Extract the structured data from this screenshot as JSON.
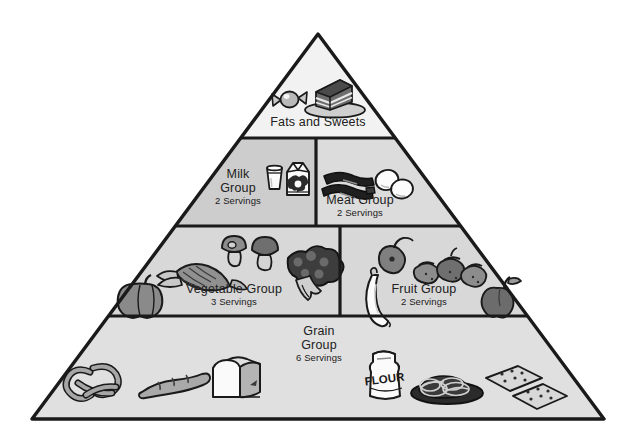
{
  "diagram": {
    "type": "food-guide-pyramid",
    "background_color": "#ffffff",
    "outline_color": "#1a1a1a",
    "tiers": [
      {
        "id": "fats-sweets",
        "label": "Fats and Sweets",
        "label_lines": [
          "Fats and Sweets"
        ],
        "servings": "",
        "fill_color": "#f2f2f2",
        "tier_index": 1,
        "icons": [
          "wrapped-candy-icon",
          "cake-slice-icon"
        ]
      },
      {
        "id": "milk-group",
        "label": "Milk Group",
        "label_lines": [
          "Milk",
          "Group"
        ],
        "servings": "2 Servings",
        "servings_count": 2,
        "fill_color": "#cdcdcd",
        "tier_index": 2,
        "icons": [
          "milk-glass-icon",
          "milk-carton-icon"
        ]
      },
      {
        "id": "meat-group",
        "label": "Meat Group",
        "label_lines": [
          "Meat Group"
        ],
        "servings": "2 Servings",
        "servings_count": 2,
        "fill_color": "#dcdcdc",
        "tier_index": 2,
        "icons": [
          "bacon-icon",
          "eggs-icon"
        ]
      },
      {
        "id": "vegetable-group",
        "label": "Vegetable Group",
        "label_lines": [
          "Vegetable Group"
        ],
        "servings": "3 Servings",
        "servings_count": 3,
        "fill_color": "#d8d8d8",
        "tier_index": 3,
        "icons": [
          "squash-icon",
          "corn-icon",
          "mushrooms-icon",
          "broccoli-icon"
        ]
      },
      {
        "id": "fruit-group",
        "label": "Fruit Group",
        "label_lines": [
          "Fruit Group"
        ],
        "servings": "2 Servings",
        "servings_count": 2,
        "fill_color": "#d8d8d8",
        "tier_index": 3,
        "icons": [
          "pear-icon",
          "strawberries-icon",
          "banana-icon",
          "apple-icon"
        ]
      },
      {
        "id": "grain-group",
        "label": "Grain Group",
        "label_lines": [
          "Grain",
          "Group"
        ],
        "servings": "6 Servings",
        "servings_count": 6,
        "fill_color": "#e0e0e0",
        "tier_index": 4,
        "icons": [
          "pretzel-icon",
          "baguette-icon",
          "bread-loaf-icon",
          "flour-bag-icon",
          "spaghetti-plate-icon",
          "crackers-icon"
        ]
      }
    ],
    "icon_text": {
      "flour_bag": "FLOUR"
    }
  }
}
